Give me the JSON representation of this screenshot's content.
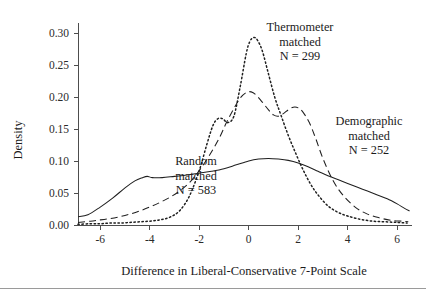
{
  "figure": {
    "background": "#ffffff",
    "ink_color": "#1f1f1f"
  },
  "axes": {
    "y_label": "Density",
    "x_label": "Difference in Liberal-Conservative 7-Point Scale",
    "x_ticks": [
      "-6",
      "-4",
      "-2",
      "0",
      "2",
      "4",
      "6"
    ],
    "y_ticks": [
      "0.00",
      "0.05",
      "0.10",
      "0.15",
      "0.20",
      "0.25",
      "0.30"
    ]
  },
  "annotations": [
    {
      "id": "thermometer",
      "line1": "Thermometer",
      "line2": "matched",
      "line3": "N = 299"
    },
    {
      "id": "demographic",
      "line1": "Demographic",
      "line2": "matched",
      "line3": "N = 252"
    },
    {
      "id": "random",
      "line1": "Random",
      "line2": "matched",
      "line3": "N = 583"
    }
  ],
  "chart_data": {
    "type": "line",
    "title": "",
    "xlabel": "Difference in Liberal-Conservative 7-Point Scale",
    "ylabel": "Density",
    "xlim": [
      -6.9,
      6.6
    ],
    "ylim": [
      0.0,
      0.315
    ],
    "xticks": [
      -6,
      -4,
      -2,
      0,
      2,
      4,
      6
    ],
    "yticks": [
      0.0,
      0.05,
      0.1,
      0.15,
      0.2,
      0.25,
      0.3
    ],
    "grid": false,
    "legend_position": "inline-annotations",
    "series": [
      {
        "name": "Thermometer matched",
        "n": 299,
        "style": "dotted",
        "x": [
          -6.9,
          -6.4,
          -6.0,
          -5.6,
          -5.2,
          -4.8,
          -4.4,
          -4.0,
          -3.6,
          -3.2,
          -2.8,
          -2.4,
          -2.0,
          -1.7,
          -1.45,
          -1.25,
          -1.05,
          -0.85,
          -0.6,
          -0.35,
          -0.1,
          0.05,
          0.2,
          0.35,
          0.55,
          0.8,
          1.05,
          1.3,
          1.6,
          1.9,
          2.2,
          2.5,
          2.8,
          3.2,
          3.6,
          4.0,
          4.5,
          5.0,
          5.5,
          6.0,
          6.4
        ],
        "y": [
          0.001,
          0.002,
          0.002,
          0.003,
          0.003,
          0.004,
          0.005,
          0.006,
          0.008,
          0.012,
          0.022,
          0.045,
          0.085,
          0.125,
          0.155,
          0.166,
          0.166,
          0.16,
          0.17,
          0.215,
          0.268,
          0.287,
          0.293,
          0.289,
          0.272,
          0.236,
          0.2,
          0.172,
          0.14,
          0.112,
          0.086,
          0.064,
          0.047,
          0.03,
          0.02,
          0.014,
          0.009,
          0.006,
          0.005,
          0.004,
          0.003
        ]
      },
      {
        "name": "Demographic matched",
        "n": 252,
        "style": "dashed",
        "x": [
          -6.9,
          -6.4,
          -6.0,
          -5.6,
          -5.2,
          -4.8,
          -4.4,
          -4.0,
          -3.6,
          -3.2,
          -2.8,
          -2.4,
          -2.0,
          -1.6,
          -1.2,
          -0.9,
          -0.6,
          -0.35,
          -0.1,
          0.1,
          0.3,
          0.55,
          0.8,
          1.0,
          1.2,
          1.4,
          1.6,
          1.8,
          2.0,
          2.2,
          2.45,
          2.7,
          3.0,
          3.4,
          3.8,
          4.3,
          4.8,
          5.3,
          5.8,
          6.2,
          6.45
        ],
        "y": [
          0.004,
          0.006,
          0.008,
          0.01,
          0.013,
          0.017,
          0.022,
          0.028,
          0.035,
          0.043,
          0.053,
          0.066,
          0.085,
          0.108,
          0.135,
          0.16,
          0.182,
          0.198,
          0.207,
          0.208,
          0.203,
          0.192,
          0.18,
          0.172,
          0.17,
          0.174,
          0.18,
          0.184,
          0.183,
          0.176,
          0.16,
          0.136,
          0.104,
          0.07,
          0.047,
          0.028,
          0.017,
          0.011,
          0.007,
          0.006,
          0.005
        ]
      },
      {
        "name": "Random matched",
        "n": 583,
        "style": "solid",
        "x": [
          -6.9,
          -6.5,
          -6.0,
          -5.5,
          -5.0,
          -4.6,
          -4.3,
          -4.1,
          -3.9,
          -3.5,
          -3.0,
          -2.5,
          -2.0,
          -1.5,
          -1.0,
          -0.5,
          0.0,
          0.4,
          0.8,
          1.2,
          1.6,
          2.0,
          2.4,
          2.8,
          3.2,
          3.6,
          4.0,
          4.4,
          4.8,
          5.2,
          5.6,
          6.0,
          6.3,
          6.5
        ],
        "y": [
          0.013,
          0.016,
          0.028,
          0.042,
          0.058,
          0.069,
          0.074,
          0.076,
          0.074,
          0.074,
          0.076,
          0.078,
          0.081,
          0.084,
          0.088,
          0.094,
          0.1,
          0.103,
          0.104,
          0.103,
          0.101,
          0.097,
          0.091,
          0.084,
          0.077,
          0.071,
          0.065,
          0.059,
          0.053,
          0.047,
          0.041,
          0.033,
          0.026,
          0.022
        ]
      }
    ]
  }
}
